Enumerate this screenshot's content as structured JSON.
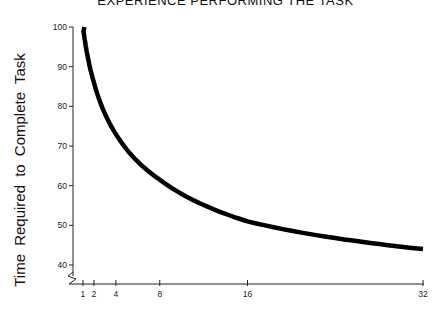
{
  "chart_data": {
    "type": "line",
    "title": "EXPERIENCE PERFORMING THE TASK",
    "xlabel": "",
    "ylabel": "Time Required to Complete Task",
    "x": [
      1,
      2,
      4,
      8,
      16,
      32
    ],
    "series": [
      {
        "name": "Learning curve",
        "values": [
          100,
          86,
          73,
          61.5,
          51,
          44
        ]
      }
    ],
    "x_ticks": [
      "1",
      "2",
      "4",
      "8",
      "16",
      "32"
    ],
    "y_ticks": [
      "40",
      "50",
      "60",
      "70",
      "80",
      "90",
      "100"
    ],
    "ylim": [
      35,
      100
    ],
    "xlim": [
      0,
      32
    ],
    "y_axis_break": true,
    "grid": false,
    "legend": "none",
    "line_color": "#000000"
  }
}
